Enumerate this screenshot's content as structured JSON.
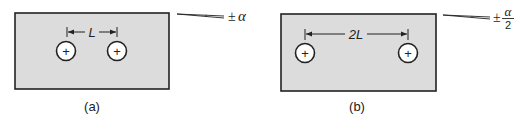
{
  "figure": {
    "colors": {
      "plate_fill": "#dcdcdc",
      "stroke": "#222222",
      "hole_fill": "#ffffff"
    },
    "panels": [
      {
        "id": "a",
        "caption": "(a)",
        "dimension_label": "L",
        "tolerance": {
          "sign": "±",
          "symbol": "α",
          "denominator": ""
        },
        "holes": [
          {
            "marker": "+"
          },
          {
            "marker": "+"
          }
        ]
      },
      {
        "id": "b",
        "caption": "(b)",
        "dimension_label": "2L",
        "tolerance": {
          "sign": "±",
          "symbol": "α",
          "denominator": "2"
        },
        "holes": [
          {
            "marker": "+"
          },
          {
            "marker": "+"
          }
        ]
      }
    ]
  }
}
